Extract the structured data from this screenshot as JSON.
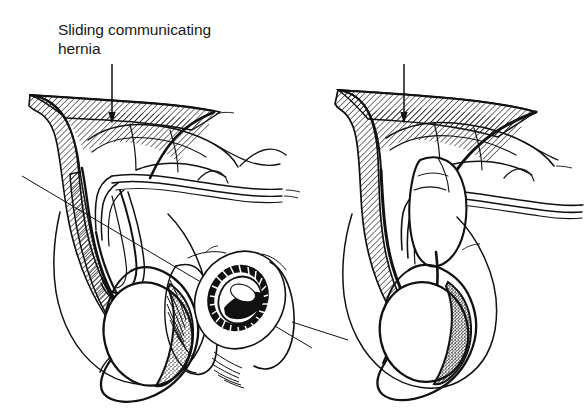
{
  "figure": {
    "type": "medical-line-illustration",
    "background_color": "#ffffff",
    "ink_color": "#111111",
    "width": 584,
    "height": 420
  },
  "panels": [
    {
      "id": "left",
      "caption": "Sliding communicating\nhernia",
      "caption_line1": "Sliding communicating",
      "caption_line2": "hernia",
      "arrow": {
        "name": "label-arrow",
        "direction": "down",
        "from_x": 112,
        "from_y": 64,
        "to_x": 112,
        "to_y": 122
      },
      "structures": [
        "hatched-abdominal-wall",
        "bowel-loops",
        "patent-processus-vaginalis",
        "scrotal-sac",
        "testis-stippled",
        "epididymis",
        "spermatic-cord-cross-section-inset",
        "leader-line-diagonal"
      ]
    },
    {
      "id": "right",
      "caption": "Sliding noncommunicating\nhernia",
      "caption_line1": "Sliding noncommunicating",
      "caption_line2": "hernia",
      "arrow": {
        "name": "label-arrow",
        "direction": "down",
        "from_x": 404,
        "from_y": 64,
        "to_x": 404,
        "to_y": 122
      },
      "structures": [
        "hatched-abdominal-wall",
        "bowel-loops",
        "hernia-sac-closed",
        "bowel-in-sac-stippled",
        "scrotal-sac",
        "testis-stippled-dense",
        "epididymis"
      ]
    }
  ],
  "inset": {
    "name": "spermatic-cord-cross-section",
    "description": "cross-sectional cut-through of cord with dark ring and hatched lumen",
    "center_x": 233,
    "center_y": 296
  },
  "hatching": {
    "angle_degrees": 45,
    "spacing_px": 4,
    "stroke_width": 1.15,
    "color": "#111111"
  },
  "stipple": {
    "color": "#111111",
    "description": "dotted shading on testis and bowel"
  }
}
